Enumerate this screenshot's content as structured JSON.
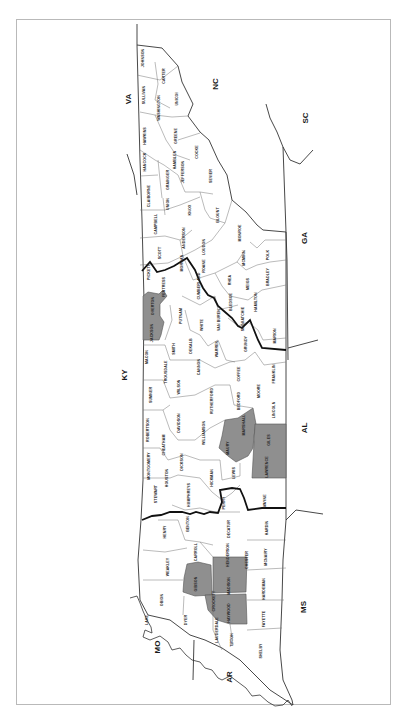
{
  "map": {
    "title": "",
    "orientation": "rotated -90deg (north to the left)",
    "shade_color": "#8f8f8f",
    "states": [
      {
        "id": "va",
        "label": "VA",
        "x": 131,
        "y": 99
      },
      {
        "id": "nc",
        "label": "NC",
        "x": 218,
        "y": 84
      },
      {
        "id": "sc",
        "label": "SC",
        "x": 308,
        "y": 118
      },
      {
        "id": "ga",
        "label": "GA",
        "x": 307,
        "y": 238
      },
      {
        "id": "ky",
        "label": "KY",
        "x": 127,
        "y": 375
      },
      {
        "id": "al",
        "label": "AL",
        "x": 307,
        "y": 428
      },
      {
        "id": "ms",
        "label": "MS",
        "x": 306,
        "y": 607
      },
      {
        "id": "mo",
        "label": "MO",
        "x": 160,
        "y": 647
      },
      {
        "id": "ar",
        "label": "AR",
        "x": 232,
        "y": 677
      }
    ],
    "counties": [
      {
        "name": "JOHNSON",
        "x": 144,
        "y": 58,
        "shaded": false
      },
      {
        "name": "CARTER",
        "x": 165,
        "y": 76,
        "shaded": false
      },
      {
        "name": "SULLIVAN",
        "x": 145,
        "y": 95,
        "shaded": false
      },
      {
        "name": "WASHINGTON",
        "x": 160,
        "y": 108,
        "shaded": false
      },
      {
        "name": "HAWKINS",
        "x": 146,
        "y": 136,
        "shaded": false
      },
      {
        "name": "UNICOI",
        "x": 178,
        "y": 99,
        "shaded": false
      },
      {
        "name": "GREENE",
        "x": 177,
        "y": 136,
        "shaded": false
      },
      {
        "name": "HANCOCK",
        "x": 146,
        "y": 162,
        "shaded": false
      },
      {
        "name": "COCKE",
        "x": 198,
        "y": 152,
        "shaded": false
      },
      {
        "name": "JEFFERSON",
        "x": 184,
        "y": 172,
        "shaded": false
      },
      {
        "name": "GRAINGER",
        "x": 169,
        "y": 180,
        "shaded": false
      },
      {
        "name": "HAMBLEN",
        "x": 176,
        "y": 160,
        "shaded": false
      },
      {
        "name": "CLAIBORNE",
        "x": 150,
        "y": 196,
        "shaded": false
      },
      {
        "name": "SEVIER",
        "x": 212,
        "y": 176,
        "shaded": false
      },
      {
        "name": "UNION",
        "x": 169,
        "y": 204,
        "shaded": false
      },
      {
        "name": "KNOX",
        "x": 191,
        "y": 210,
        "shaded": false
      },
      {
        "name": "BLOUNT",
        "x": 219,
        "y": 215,
        "shaded": false
      },
      {
        "name": "CAMPBELL",
        "x": 157,
        "y": 224,
        "shaded": false
      },
      {
        "name": "ANDERSON",
        "x": 185,
        "y": 238,
        "shaded": false
      },
      {
        "name": "SCOTT",
        "x": 161,
        "y": 253,
        "shaded": false
      },
      {
        "name": "MONROE",
        "x": 241,
        "y": 233,
        "shaded": false
      },
      {
        "name": "LOUDON",
        "x": 205,
        "y": 247,
        "shaded": false
      },
      {
        "name": "ROANE",
        "x": 205,
        "y": 266,
        "shaded": false
      },
      {
        "name": "MORGAN",
        "x": 183,
        "y": 263,
        "shaded": false
      },
      {
        "name": "MCMINN",
        "x": 245,
        "y": 258,
        "shaded": false
      },
      {
        "name": "POLK",
        "x": 269,
        "y": 255,
        "shaded": false
      },
      {
        "name": "FENTRESS",
        "x": 165,
        "y": 287,
        "shaded": false
      },
      {
        "name": "CUMBERLAND",
        "x": 200,
        "y": 286,
        "shaded": false
      },
      {
        "name": "RHEA",
        "x": 231,
        "y": 280,
        "shaded": false
      },
      {
        "name": "MEIGS",
        "x": 249,
        "y": 284,
        "shaded": false
      },
      {
        "name": "BRADLEY",
        "x": 269,
        "y": 277,
        "shaded": false
      },
      {
        "name": "PICKETT",
        "x": 150,
        "y": 272,
        "shaded": false
      },
      {
        "name": "OVERTON",
        "x": 154,
        "y": 306,
        "shaded": true
      },
      {
        "name": "JACKSON",
        "x": 153,
        "y": 333,
        "shaded": true
      },
      {
        "name": "PUTNAM",
        "x": 182,
        "y": 316,
        "shaded": false
      },
      {
        "name": "BLEDSOE",
        "x": 232,
        "y": 302,
        "shaded": false
      },
      {
        "name": "HAMILTON",
        "x": 257,
        "y": 302,
        "shaded": false
      },
      {
        "name": "WHITE",
        "x": 203,
        "y": 325,
        "shaded": false
      },
      {
        "name": "VAN BUREN",
        "x": 220,
        "y": 320,
        "shaded": false
      },
      {
        "name": "SEQUATCHIE",
        "x": 244,
        "y": 319,
        "shaded": false
      },
      {
        "name": "MARION",
        "x": 276,
        "y": 336,
        "shaded": false
      },
      {
        "name": "MACON",
        "x": 148,
        "y": 357,
        "shaded": false
      },
      {
        "name": "SMITH",
        "x": 175,
        "y": 349,
        "shaded": false
      },
      {
        "name": "DEKALB",
        "x": 192,
        "y": 346,
        "shaded": false
      },
      {
        "name": "WARREN",
        "x": 218,
        "y": 349,
        "shaded": false
      },
      {
        "name": "GRUNDY",
        "x": 247,
        "y": 344,
        "shaded": false
      },
      {
        "name": "CANNON",
        "x": 200,
        "y": 367,
        "shaded": false
      },
      {
        "name": "COFFEE",
        "x": 240,
        "y": 374,
        "shaded": false
      },
      {
        "name": "FRANKLIN",
        "x": 275,
        "y": 374,
        "shaded": false
      },
      {
        "name": "SUMNER",
        "x": 152,
        "y": 395,
        "shaded": false
      },
      {
        "name": "WILSON",
        "x": 180,
        "y": 387,
        "shaded": false
      },
      {
        "name": "TROUSDALE",
        "x": 167,
        "y": 372,
        "shaded": false
      },
      {
        "name": "RUTHERFORD",
        "x": 213,
        "y": 401,
        "shaded": false
      },
      {
        "name": "BEDFORD",
        "x": 240,
        "y": 401,
        "shaded": false
      },
      {
        "name": "MOORE",
        "x": 260,
        "y": 391,
        "shaded": false
      },
      {
        "name": "LINCOLN",
        "x": 275,
        "y": 410,
        "shaded": false
      },
      {
        "name": "ROBERTSON",
        "x": 149,
        "y": 430,
        "shaded": false
      },
      {
        "name": "DAVIDSON",
        "x": 180,
        "y": 423,
        "shaded": false
      },
      {
        "name": "CHEATHAM",
        "x": 165,
        "y": 445,
        "shaded": false
      },
      {
        "name": "WILLIAMSON",
        "x": 205,
        "y": 433,
        "shaded": false
      },
      {
        "name": "MARSHALL",
        "x": 245,
        "y": 425,
        "shaded": true
      },
      {
        "name": "GILES",
        "x": 270,
        "y": 440,
        "shaded": true
      },
      {
        "name": "MAURY",
        "x": 229,
        "y": 448,
        "shaded": true
      },
      {
        "name": "LAWRENCE",
        "x": 268,
        "y": 467,
        "shaded": true
      },
      {
        "name": "MONTGOMERY",
        "x": 150,
        "y": 466,
        "shaded": false
      },
      {
        "name": "DICKSON",
        "x": 183,
        "y": 462,
        "shaded": false
      },
      {
        "name": "HICKMAN",
        "x": 213,
        "y": 478,
        "shaded": false
      },
      {
        "name": "LEWIS",
        "x": 235,
        "y": 473,
        "shaded": false
      },
      {
        "name": "STEWART",
        "x": 157,
        "y": 494,
        "shaded": false
      },
      {
        "name": "HOUSTON",
        "x": 168,
        "y": 478,
        "shaded": false
      },
      {
        "name": "HUMPHREYS",
        "x": 190,
        "y": 495,
        "shaded": false
      },
      {
        "name": "PERRY",
        "x": 225,
        "y": 503,
        "shaded": false
      },
      {
        "name": "WAYNE",
        "x": 266,
        "y": 501,
        "shaded": false
      },
      {
        "name": "BENTON",
        "x": 189,
        "y": 524,
        "shaded": false
      },
      {
        "name": "DECATUR",
        "x": 230,
        "y": 529,
        "shaded": false
      },
      {
        "name": "HARDIN",
        "x": 268,
        "y": 528,
        "shaded": false
      },
      {
        "name": "HENRY",
        "x": 166,
        "y": 532,
        "shaded": false
      },
      {
        "name": "CARROLL",
        "x": 197,
        "y": 552,
        "shaded": false
      },
      {
        "name": "HENDERSON",
        "x": 229,
        "y": 555,
        "shaded": false
      },
      {
        "name": "MCNAIRY",
        "x": 267,
        "y": 557,
        "shaded": false
      },
      {
        "name": "CHESTER",
        "x": 248,
        "y": 560,
        "shaded": false
      },
      {
        "name": "WEAKLEY",
        "x": 169,
        "y": 567,
        "shaded": false
      },
      {
        "name": "GIBSON",
        "x": 197,
        "y": 584,
        "shaded": true
      },
      {
        "name": "MADISON",
        "x": 230,
        "y": 586,
        "shaded": true
      },
      {
        "name": "HARDEMAN",
        "x": 265,
        "y": 589,
        "shaded": false
      },
      {
        "name": "OBION",
        "x": 163,
        "y": 600,
        "shaded": false
      },
      {
        "name": "CROCKETT",
        "x": 215,
        "y": 601,
        "shaded": false
      },
      {
        "name": "HAYWOOD",
        "x": 230,
        "y": 613,
        "shaded": true
      },
      {
        "name": "LAKE",
        "x": 148,
        "y": 620,
        "shaded": false
      },
      {
        "name": "DYER",
        "x": 187,
        "y": 620,
        "shaded": false
      },
      {
        "name": "FAYETTE",
        "x": 265,
        "y": 619,
        "shaded": false
      },
      {
        "name": "LAUDERDALE",
        "x": 218,
        "y": 630,
        "shaded": false
      },
      {
        "name": "TIPTON",
        "x": 233,
        "y": 640,
        "shaded": false
      },
      {
        "name": "SHELBY",
        "x": 262,
        "y": 651,
        "shaded": false
      }
    ]
  }
}
